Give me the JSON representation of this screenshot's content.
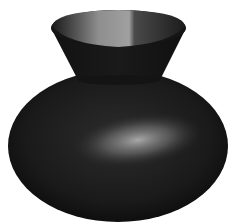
{
  "scene": {
    "subject": "3D rendered vase",
    "background": "#ffffff",
    "colors": {
      "body_dark": "#101010",
      "body_mid": "#2a2a2a",
      "highlight": "#a8a8a8",
      "rim_inner_light": "#9a9a9a"
    }
  }
}
